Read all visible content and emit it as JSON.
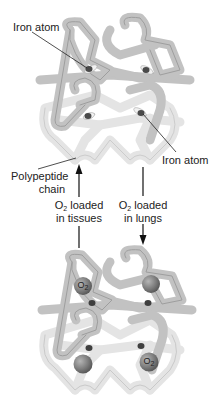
{
  "diagram": {
    "top_molecule": {
      "state": "deoxygenated",
      "labels": {
        "iron_atom_top": "Iron atom",
        "iron_atom_right": "Iron atom",
        "polypeptide_line1": "Polypeptide",
        "polypeptide_line2": "chain"
      }
    },
    "arrows": {
      "left": {
        "direction": "up",
        "prefix": "O",
        "subscript": "2",
        "line1_suffix": " loaded",
        "line2": "in tissues"
      },
      "right": {
        "direction": "down",
        "prefix": "O",
        "subscript": "2",
        "line1_suffix": " loaded",
        "line2": "in lungs"
      }
    },
    "bottom_molecule": {
      "state": "oxygenated",
      "o2_labels": [
        {
          "prefix": "O",
          "subscript": "2"
        },
        {
          "prefix": "O",
          "subscript": "2"
        }
      ]
    },
    "colors": {
      "chain_dark": "#bdbdbd",
      "chain_light": "#dedede",
      "chain_outline": "#9a9a9a",
      "iron": "#4a4a4a",
      "o2_sphere": "#7d7d7d",
      "leader_line": "#222222"
    }
  }
}
